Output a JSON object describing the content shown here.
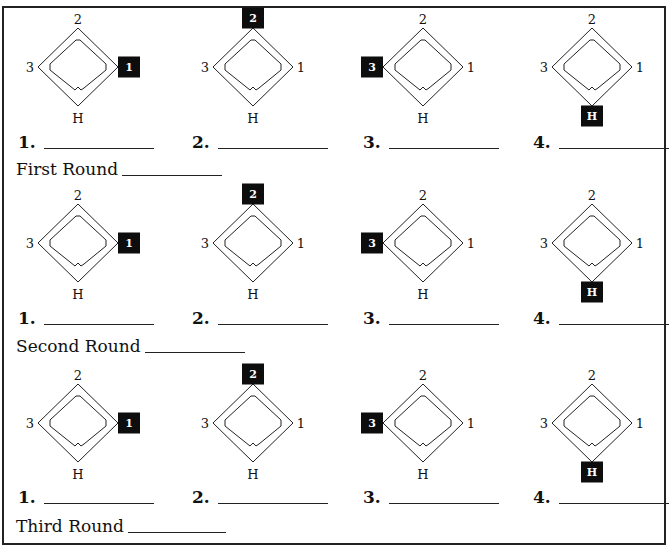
{
  "worksheet": {
    "rounds": [
      {
        "label": "First Round",
        "diagrams": [
          {
            "answer_number": "1.",
            "highlight": "1"
          },
          {
            "answer_number": "2.",
            "highlight": "2"
          },
          {
            "answer_number": "3.",
            "highlight": "3"
          },
          {
            "answer_number": "4.",
            "highlight": "H"
          }
        ]
      },
      {
        "label": "Second Round",
        "diagrams": [
          {
            "answer_number": "1.",
            "highlight": "1"
          },
          {
            "answer_number": "2.",
            "highlight": "2"
          },
          {
            "answer_number": "3.",
            "highlight": "3"
          },
          {
            "answer_number": "4.",
            "highlight": "H"
          }
        ]
      },
      {
        "label": "Third Round",
        "diagrams": [
          {
            "answer_number": "1.",
            "highlight": "1"
          },
          {
            "answer_number": "2.",
            "highlight": "2"
          },
          {
            "answer_number": "3.",
            "highlight": "3"
          },
          {
            "answer_number": "4.",
            "highlight": "H"
          }
        ]
      }
    ],
    "base_labels": {
      "first": "1",
      "second": "2",
      "third": "3",
      "home": "H"
    },
    "colors": {
      "ink": "#111111",
      "highlight_box": "#0d0d0d",
      "highlight_text": "#ffffff",
      "paper": "#ffffff"
    }
  }
}
